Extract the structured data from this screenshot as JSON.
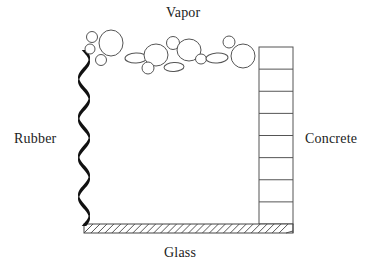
{
  "figure": {
    "type": "cross-section-diagram",
    "background_color": "#ffffff",
    "ink_color": "#1c1c1c",
    "line_color": "#555555"
  },
  "labels": {
    "vapor": "Vapor",
    "rubber": "Rubber",
    "concrete": "Concrete",
    "glass": "Glass"
  },
  "parts": {
    "rubber": {
      "name": "Rubber",
      "style": "thick wavy black vertical stroke",
      "fill": "#111111",
      "x": 84,
      "y_top": 50,
      "y_bottom": 226
    },
    "glass": {
      "name": "Glass",
      "style": "horizontal hatched bar",
      "x_left": 84,
      "x_right": 293,
      "y_top": 224,
      "y_bottom": 233,
      "hatch_count": 30,
      "hatch_color": "#444444"
    },
    "concrete": {
      "name": "Concrete",
      "style": "segmented column of stacked blocks",
      "x_left": 259,
      "x_right": 293,
      "y_top": 47,
      "y_bottom": 224,
      "cells": 8,
      "stroke": "#555555"
    },
    "vapor": {
      "name": "Vapor",
      "style": "outlined bubbles of varying size",
      "stroke": "#555555",
      "bubble_count": 20
    }
  },
  "chart_data": {
    "type": "diagram",
    "title": "Vapor",
    "bubbles": [
      {
        "cx": 92,
        "cy": 37,
        "rx": 5.5,
        "ry": 5.5,
        "rot": 0
      },
      {
        "cx": 90,
        "cy": 49,
        "rx": 5,
        "ry": 5,
        "rot": 0
      },
      {
        "cx": 111,
        "cy": 43,
        "rx": 12,
        "ry": 13,
        "rot": 0
      },
      {
        "cx": 101,
        "cy": 60,
        "rx": 5.5,
        "ry": 5.5,
        "rot": 0
      },
      {
        "cx": 136,
        "cy": 58,
        "rx": 11,
        "ry": 5,
        "rot": -2
      },
      {
        "cx": 156,
        "cy": 55,
        "rx": 12,
        "ry": 11,
        "rot": 0
      },
      {
        "cx": 148,
        "cy": 68,
        "rx": 6,
        "ry": 6,
        "rot": 0
      },
      {
        "cx": 174,
        "cy": 67,
        "rx": 10,
        "ry": 4.5,
        "rot": -3
      },
      {
        "cx": 173,
        "cy": 43,
        "rx": 6.5,
        "ry": 6.5,
        "rot": 0
      },
      {
        "cx": 189,
        "cy": 50,
        "rx": 12,
        "ry": 11,
        "rot": 0
      },
      {
        "cx": 201,
        "cy": 59,
        "rx": 5.5,
        "ry": 5,
        "rot": 0
      },
      {
        "cx": 217,
        "cy": 58,
        "rx": 11,
        "ry": 5,
        "rot": -4
      },
      {
        "cx": 229,
        "cy": 42,
        "rx": 6,
        "ry": 6,
        "rot": 0
      },
      {
        "cx": 243,
        "cy": 56,
        "rx": 12,
        "ry": 12,
        "rot": 0
      }
    ]
  }
}
